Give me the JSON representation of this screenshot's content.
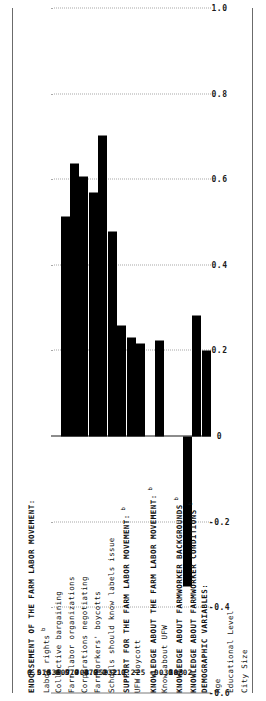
{
  "figure": {
    "orientation": "rotated-90",
    "axis": {
      "label": "",
      "min": -0.6,
      "max": 1.0,
      "ticks": [
        "-0.6",
        "-0.4",
        "-0.2",
        "0",
        "0.2",
        "0.4",
        "0.6",
        "0.8",
        "1.0"
      ],
      "tick_values": [
        -0.6,
        -0.4,
        -0.2,
        0,
        0.2,
        0.4,
        0.6,
        0.8,
        1.0
      ],
      "grid": "dotted"
    },
    "colors": {
      "bar": "#000000",
      "grid": "#a8a8a8",
      "axis": "#1a1a1a",
      "frame": "#6b6b6b",
      "text": "#111111",
      "background": "#ffffff"
    }
  },
  "rows": [
    {
      "label": "ENDORSEMENT OF THE FARM LABOR MOVEMENT:",
      "sup": "",
      "header": true,
      "value": null,
      "value_label": ""
    },
    {
      "label": "Labor rights",
      "sup": "b",
      "header": false,
      "value": 0.513,
      "value_label": "0.513"
    },
    {
      "label": "Collective bargaining",
      "sup": "",
      "header": false,
      "value": 0.638,
      "value_label": "0.638"
    },
    {
      "label": "Farm labor organizations",
      "sup": "",
      "header": false,
      "value": 0.607,
      "value_label": "0.607"
    },
    {
      "label": "Corporations negotiating",
      "sup": "",
      "header": false,
      "value": 0.57,
      "value_label": "0.570"
    },
    {
      "label": "Farmworkers' boycotts",
      "sup": "",
      "header": false,
      "value": 0.703,
      "value_label": "0.703"
    },
    {
      "label": "Schools should know labels issue",
      "sup": "",
      "header": false,
      "value": 0.479,
      "value_label": "0.479"
    },
    {
      "label": "SUPPORT FOR THE FARM LABOR MOVEMENT:",
      "sup": "b",
      "header": true,
      "value": 0.259,
      "value_label": "0.259"
    },
    {
      "label": "UFW Boycott",
      "sup": "",
      "header": false,
      "value": 0.232,
      "value_label": "0.232"
    },
    {
      "label": "KNOWLEDGE ABOUT THE FARM LABOR MOVEMENT:",
      "sup": "b",
      "header": true,
      "value": 0.217,
      "value_label": "0.217"
    },
    {
      "label": "Know about UFW",
      "sup": "",
      "header": false,
      "value": null,
      "value_label": ""
    },
    {
      "label": "KNOWLEDGE ABOUT FARMWORKER BACKGROUNDS",
      "sup": "b",
      "header": true,
      "value": 0.225,
      "value_label": "0.225"
    },
    {
      "label": "KNOWLEDGE ABOUT FARMWORKER CONDITIONS",
      "sup": "b",
      "header": true,
      "value": null,
      "value_label": ""
    },
    {
      "label": "DEMOGRAPHIC VARIABLES:",
      "sup": "",
      "header": true,
      "value": null,
      "value_label": ""
    },
    {
      "label": "Age",
      "sup": "",
      "header": false,
      "value": -0.35,
      "value_label": "-0.350"
    },
    {
      "label": "Educational Level",
      "sup": "",
      "header": false,
      "value": 0.283,
      "value_label": "0.283"
    },
    {
      "label": "City Size",
      "sup": "",
      "header": false,
      "value": 0.202,
      "value_label": "0.202"
    }
  ],
  "chart_data": {
    "type": "bar",
    "title": "",
    "subtitle": "",
    "xlabel": "",
    "ylabel": "",
    "orientation": "horizontal",
    "categories": [
      "Labor rights",
      "Collective bargaining",
      "Farm labor organizations",
      "Corporations negotiating",
      "Farmworkers' boycotts",
      "Schools should know labels issue",
      "SUPPORT FOR THE FARM LABOR MOVEMENT:",
      "UFW Boycott",
      "KNOWLEDGE ABOUT THE FARM LABOR MOVEMENT:",
      "KNOWLEDGE ABOUT FARMWORKER BACKGROUNDS",
      "Age",
      "Educational Level",
      "City Size"
    ],
    "values": [
      0.513,
      0.638,
      0.607,
      0.57,
      0.703,
      0.479,
      0.259,
      0.232,
      0.217,
      0.225,
      -0.35,
      0.283,
      0.202
    ],
    "data_labels": [
      "0.513",
      "0.638",
      "0.607",
      "0.570",
      "0.703",
      "0.479",
      "0.259",
      "0.232",
      "0.217",
      "0.225",
      "-0.350",
      "0.283",
      "0.202"
    ],
    "section_headers": [
      "ENDORSEMENT OF THE FARM LABOR MOVEMENT:",
      "SUPPORT FOR THE FARM LABOR MOVEMENT:",
      "KNOWLEDGE ABOUT THE FARM LABOR MOVEMENT:",
      "KNOWLEDGE ABOUT FARMWORKER BACKGROUNDS",
      "KNOWLEDGE ABOUT FARMWORKER CONDITIONS",
      "DEMOGRAPHIC VARIABLES:"
    ],
    "xlim": [
      -0.6,
      1.0
    ],
    "xticks": [
      -0.6,
      -0.4,
      -0.2,
      0,
      0.2,
      0.4,
      0.6,
      0.8,
      1.0
    ],
    "xtick_labels": [
      "-0.6",
      "-0.4",
      "-0.2",
      "0",
      "0.2",
      "0.4",
      "0.6",
      "0.8",
      "1.0"
    ],
    "grid": true,
    "legend": null,
    "annotations": [
      "b"
    ]
  }
}
